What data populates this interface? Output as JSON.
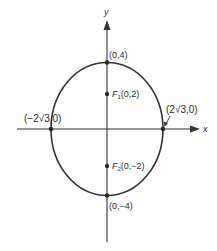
{
  "diagram": {
    "type": "ellipse-graph",
    "axes": {
      "x_label": "x",
      "y_label": "y"
    },
    "ellipse": {
      "center": "(0,0)",
      "semi_major": 4,
      "semi_minor": "2√3",
      "orientation": "vertical"
    },
    "points": {
      "top_vertex": "(0,4)",
      "bottom_vertex": "(0,−4)",
      "left_covertex": "(−2√3,0)",
      "right_covertex": "(2√3,0)",
      "focus1_name": "F",
      "focus1_sub": "1",
      "focus1_coords": "(0,2)",
      "focus2_name": "F",
      "focus2_sub": "2",
      "focus2_coords": "(0,−2)"
    },
    "colors": {
      "stroke": "#333333",
      "point": "#2a2a2a",
      "background": "#ffffff"
    }
  }
}
